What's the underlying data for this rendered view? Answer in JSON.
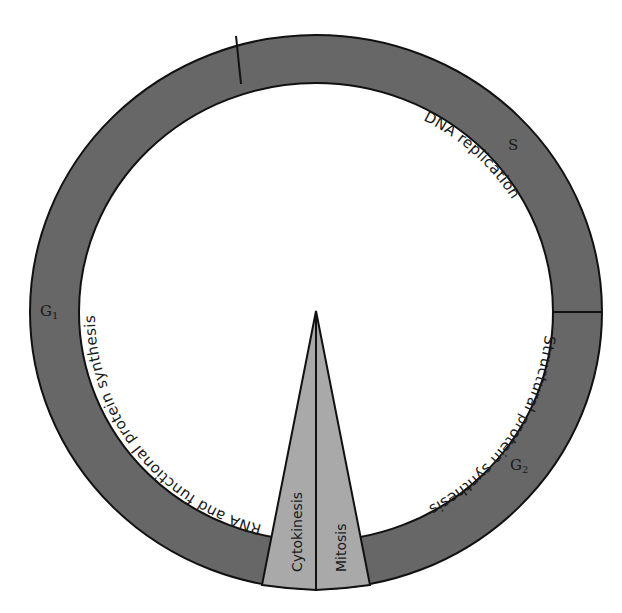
{
  "diagram": {
    "colors": {
      "ring": "#676767",
      "wedge": "#a9a9a9",
      "outline": "#111111",
      "background": "#ffffff"
    },
    "phases": [
      {
        "id": "G1",
        "label": "G",
        "subscript": "1",
        "process": "RNA and functional protein synthesis"
      },
      {
        "id": "S",
        "label": "S",
        "subscript": "",
        "process": "DNA replication"
      },
      {
        "id": "G2",
        "label": "G",
        "subscript": "2",
        "process": "Structural protein synthesis"
      }
    ],
    "wedge": {
      "left_label": "Cytokinesis",
      "right_label": "Mitosis"
    }
  }
}
